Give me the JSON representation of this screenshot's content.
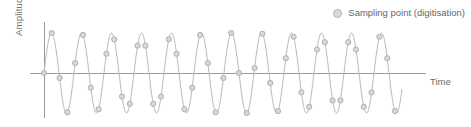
{
  "chart_data": {
    "type": "line",
    "title": "",
    "subtitle": "",
    "xlabel": "Time",
    "ylabel": "Amplitude",
    "grid": false,
    "legend_position": "top-right",
    "legend": [
      {
        "name": "Sampling point (digitisation)",
        "marker": "circle",
        "marker_fill": "#d9d9d9",
        "marker_stroke": "#b0b0b0"
      }
    ],
    "series": [
      {
        "name": "Analogue signal",
        "type": "sine",
        "amplitude": 1.0,
        "cycles": 13,
        "period_px": 30,
        "phase": 0,
        "stroke": "#b9b9b9",
        "stroke_width": 1,
        "x_start_px": 44,
        "x_end_px": 402,
        "baseline_px": 73,
        "amplitude_px": 40
      },
      {
        "name": "Sampling point (digitisation)",
        "type": "scatter",
        "sample_interval_px": 7.8,
        "sample_count": 47,
        "marker_radius_px": 2.6,
        "marker_fill": "#d9d9d9",
        "marker_stroke": "#b0b0b0"
      }
    ],
    "axes": {
      "y_axis_x_px": 44,
      "y_axis_top_px": 22,
      "y_axis_bottom_px": 118,
      "x_axis_y_px": 73,
      "x_axis_left_px": 30,
      "x_axis_right_px": 426,
      "axis_color": "#9a9a9a",
      "axis_width_px": 1
    },
    "ylim": [
      -1.15,
      1.15
    ],
    "xlim": [
      0,
      13
    ],
    "tick_labels_x": [],
    "tick_labels_y": []
  },
  "labels": {
    "y_axis": "Amplitude",
    "x_axis": "Time",
    "legend_entry": "Sampling point (digitisation)"
  },
  "colors": {
    "background": "#ffffff",
    "curve": "#b9b9b9",
    "axis": "#9a9a9a",
    "marker_fill": "#d9d9d9",
    "marker_stroke": "#b0b0b0",
    "text": "#6b6b6b"
  }
}
